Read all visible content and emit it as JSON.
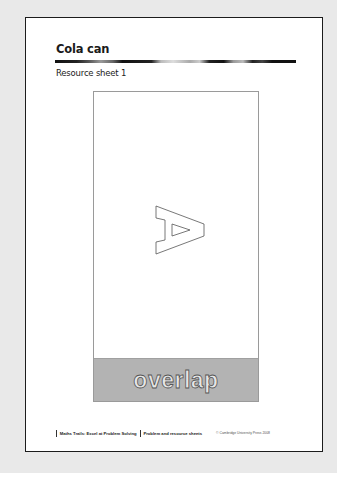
{
  "document": {
    "title": "Cola can",
    "subtitle": "Resource sheet 1",
    "figure": {
      "glyph": "A",
      "glyph_orientation": "rotated 90 degrees, outline only",
      "band_label": "overlap",
      "colors": {
        "band": "#b3b3b3",
        "box_border": "#9a9a9a",
        "band_text_fill": "#e6e6e6",
        "band_text_stroke": "#555555"
      }
    },
    "footer": {
      "book_title": "Maths Trails: Excel at Problem Solving",
      "section": "Problem and resource sheets",
      "copyright": "© Cambridge University Press 2008"
    }
  }
}
